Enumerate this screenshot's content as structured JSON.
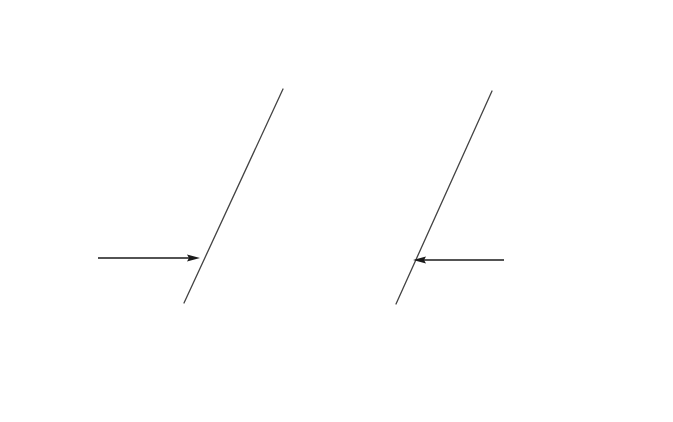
{
  "diagram": {
    "title": "",
    "colors": {
      "line": "#1a1a1a",
      "weld_line": "#444444",
      "background": "#ffffff"
    },
    "left_plate": {
      "top_face": [
        [
          173,
          28
        ],
        [
          376,
          29
        ],
        [
          232,
          351
        ],
        [
          29,
          350
        ]
      ],
      "bevel_face": [
        [
          376,
          29
        ],
        [
          412,
          75
        ],
        [
          265,
          395
        ],
        [
          232,
          351
        ]
      ],
      "front_face": [
        [
          29,
          350
        ],
        [
          232,
          351
        ],
        [
          265,
          395
        ],
        [
          28,
          396
        ]
      ],
      "weld_line": [
        [
          283,
          89
        ],
        [
          184,
          303
        ]
      ],
      "arrow": {
        "from": [
          98,
          258
        ],
        "to": [
          200,
          258
        ],
        "direction": "right"
      }
    },
    "right_plate": {
      "top_face": [
        [
          447,
          30
        ],
        [
          650,
          32
        ],
        [
          505,
          352
        ],
        [
          302,
          352
        ]
      ],
      "bevel_face": [
        [
          412,
          75
        ],
        [
          447,
          30
        ],
        [
          302,
          352
        ],
        [
          265,
          395
        ]
      ],
      "front_face": [
        [
          302,
          352
        ],
        [
          505,
          352
        ],
        [
          506,
          398
        ],
        [
          265,
          396
        ]
      ],
      "side_face": [
        [
          650,
          32
        ],
        [
          649,
          75
        ],
        [
          506,
          398
        ],
        [
          505,
          352
        ]
      ],
      "weld_line": [
        [
          492,
          91
        ],
        [
          396,
          304
        ]
      ],
      "arrow": {
        "from": [
          504,
          260
        ],
        "to": [
          413,
          260
        ],
        "direction": "left"
      }
    },
    "labels": []
  }
}
